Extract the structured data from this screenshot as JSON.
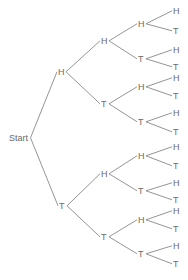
{
  "diagram": {
    "type": "tree",
    "root": {
      "label": "Start",
      "x": 9,
      "y": 141
    },
    "level1": [
      {
        "label": "H",
        "x": 58,
        "y": 75
      },
      {
        "label": "T",
        "x": 59,
        "y": 209
      }
    ],
    "level2": [
      {
        "label": "H",
        "x": 101,
        "y": 44
      },
      {
        "label": "T",
        "x": 101,
        "y": 107
      },
      {
        "label": "H",
        "x": 101,
        "y": 177
      },
      {
        "label": "T",
        "x": 101,
        "y": 240
      }
    ],
    "level3": [
      {
        "label": "H",
        "x": 138,
        "y": 27
      },
      {
        "label": "T",
        "x": 138,
        "y": 62
      },
      {
        "label": "H",
        "x": 138,
        "y": 90
      },
      {
        "label": "T",
        "x": 138,
        "y": 125
      },
      {
        "label": "H",
        "x": 138,
        "y": 159
      },
      {
        "label": "T",
        "x": 138,
        "y": 194
      },
      {
        "label": "H",
        "x": 138,
        "y": 223
      },
      {
        "label": "T",
        "x": 138,
        "y": 257
      }
    ],
    "leaves": [
      {
        "label": "H",
        "x": 173,
        "y": 14
      },
      {
        "label": "T",
        "x": 173,
        "y": 34
      },
      {
        "label": "H",
        "x": 173,
        "y": 53
      },
      {
        "label": "T",
        "x": 173,
        "y": 70
      },
      {
        "label": "H",
        "x": 173,
        "y": 81
      },
      {
        "label": "T",
        "x": 173,
        "y": 99
      },
      {
        "label": "H",
        "x": 173,
        "y": 116
      },
      {
        "label": "T",
        "x": 173,
        "y": 135
      },
      {
        "label": "H",
        "x": 173,
        "y": 150
      },
      {
        "label": "T",
        "x": 173,
        "y": 169
      },
      {
        "label": "H",
        "x": 173,
        "y": 186
      },
      {
        "label": "T",
        "x": 173,
        "y": 203
      },
      {
        "label": "H",
        "x": 173,
        "y": 214
      },
      {
        "label": "T",
        "x": 173,
        "y": 232
      },
      {
        "label": "H",
        "x": 173,
        "y": 249
      },
      {
        "label": "T",
        "x": 173,
        "y": 267
      }
    ]
  },
  "colors": {
    "line": "#7a7a7a",
    "text": "#6a6a6a"
  }
}
